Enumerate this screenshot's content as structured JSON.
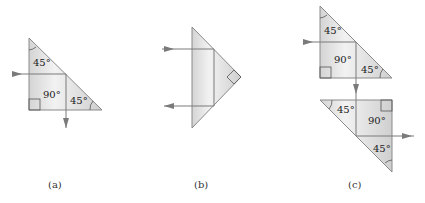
{
  "figure": {
    "panels": [
      {
        "caption": "(a)",
        "description": "45-45-90 prism, 90° total internal reflection",
        "angles": [
          "45°",
          "90°",
          "45°"
        ]
      },
      {
        "caption": "(b)",
        "description": "Prism used as retroreflector (180° deviation)",
        "angles": []
      },
      {
        "caption": "(c)",
        "description": "Two prisms producing lateral displacement",
        "top_prism_angles": [
          "45°",
          "90°",
          "45°"
        ],
        "bottom_prism_angles": [
          "45°",
          "90°",
          "45°"
        ]
      }
    ],
    "colors": {
      "prism_fill": "#d8d8d8",
      "prism_stroke": "#8a8a8a",
      "ray": "#7a7a7a"
    }
  }
}
